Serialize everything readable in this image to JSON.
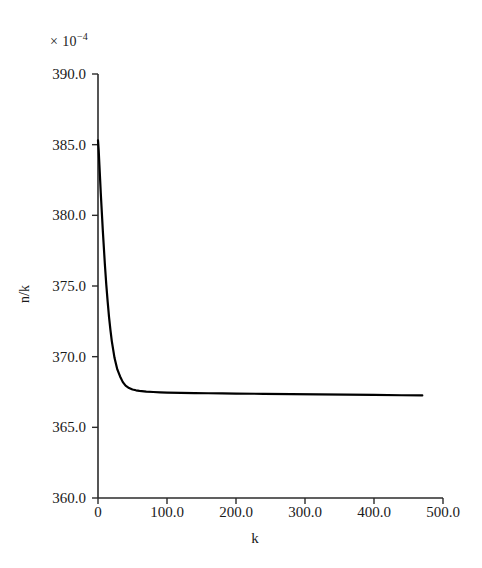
{
  "figure": {
    "background": "#ffffff",
    "multiplier_prefix": "× 10",
    "multiplier_exponent": "−4"
  },
  "axes": {
    "ylabel": "n/k",
    "xlabel": "k",
    "y_ticks": [
      "360.0",
      "365.0",
      "370.0",
      "375.0",
      "380.0",
      "385.0",
      "390.0"
    ],
    "x_ticks": [
      "0",
      "100.0",
      "200.0",
      "300.0",
      "400.0",
      "500.0"
    ]
  },
  "chart_data": {
    "type": "line",
    "title": "",
    "subtitle": "",
    "xlabel": "k",
    "ylabel": "n/k",
    "y_multiplier": "× 10^-4",
    "xlim": [
      0,
      500
    ],
    "ylim": [
      360.0,
      390.0
    ],
    "xticks": [
      0,
      100,
      200,
      300,
      400,
      500
    ],
    "yticks": [
      360.0,
      365.0,
      370.0,
      375.0,
      380.0,
      385.0,
      390.0
    ],
    "xtick_labels": [
      "0",
      "100.0",
      "200.0",
      "300.0",
      "400.0",
      "500.0"
    ],
    "ytick_labels": [
      "360.0",
      "365.0",
      "370.0",
      "375.0",
      "380.0",
      "385.0",
      "390.0"
    ],
    "grid": false,
    "legend": null,
    "line_color": "#000000",
    "line_width": 2.0,
    "annotations": [],
    "series": [
      {
        "name": "n/k",
        "x": [
          0,
          1,
          2,
          3,
          4,
          5,
          6,
          7,
          8,
          9,
          10,
          12,
          14,
          16,
          18,
          20,
          24,
          28,
          32,
          36,
          40,
          45,
          50,
          55,
          60,
          70,
          80,
          90,
          100,
          120,
          140,
          160,
          180,
          200,
          240,
          280,
          320,
          360,
          400,
          440,
          470
        ],
        "y": [
          385.3,
          384.6,
          383.6,
          382.6,
          381.6,
          380.7,
          379.8,
          378.9,
          378.1,
          377.3,
          376.5,
          375.1,
          373.9,
          372.8,
          371.9,
          371.1,
          369.9,
          369.1,
          368.6,
          368.2,
          367.95,
          367.78,
          367.68,
          367.62,
          367.58,
          367.53,
          367.5,
          367.48,
          367.46,
          367.44,
          367.42,
          367.41,
          367.4,
          367.39,
          367.37,
          367.35,
          367.33,
          367.31,
          367.29,
          367.27,
          367.26
        ]
      }
    ]
  }
}
